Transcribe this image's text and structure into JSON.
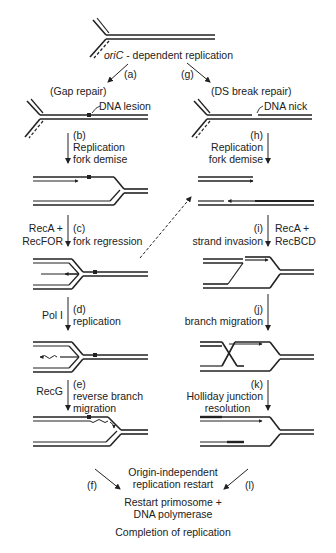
{
  "title": {
    "prefix": "oriC",
    "suffix": " - dependent replication"
  },
  "left_branch": {
    "step_a": "(a)",
    "heading": "(Gap repair)",
    "lesion_label": "DNA lesion",
    "step_b": {
      "letter": "(b)",
      "line1": "Replication",
      "line2": "fork demise"
    },
    "step_c": {
      "letter": "(c)",
      "text": "fork regression",
      "enzyme1": "RecA +",
      "enzyme2": "RecFOR"
    },
    "step_d": {
      "letter": "(d)",
      "text": "replication",
      "enzyme": "Pol I"
    },
    "step_e": {
      "letter": "(e)",
      "line1": "reverse branch",
      "line2": "migration",
      "enzyme": "RecG"
    },
    "step_f": "(f)"
  },
  "right_branch": {
    "step_g": "(g)",
    "heading": "(DS break repair)",
    "nick_label": "DNA nick",
    "step_h": {
      "letter": "(h)",
      "line1": "Replication",
      "line2": "fork demise"
    },
    "step_i": {
      "letter": "(i)",
      "text": "strand invasion",
      "enzyme1": "RecA +",
      "enzyme2": "RecBCD"
    },
    "step_j": {
      "letter": "(j)",
      "text": "branch migration"
    },
    "step_k": {
      "letter": "(k)",
      "line1": "Holliday junction",
      "line2": "resolution"
    },
    "step_l": "(l)"
  },
  "bottom": {
    "restart_line1": "Origin-independent",
    "restart_line2": "replication restart",
    "primosome_line1": "Restart primosome +",
    "primosome_line2": "DNA polymerase",
    "completion": "Completion of replication"
  }
}
